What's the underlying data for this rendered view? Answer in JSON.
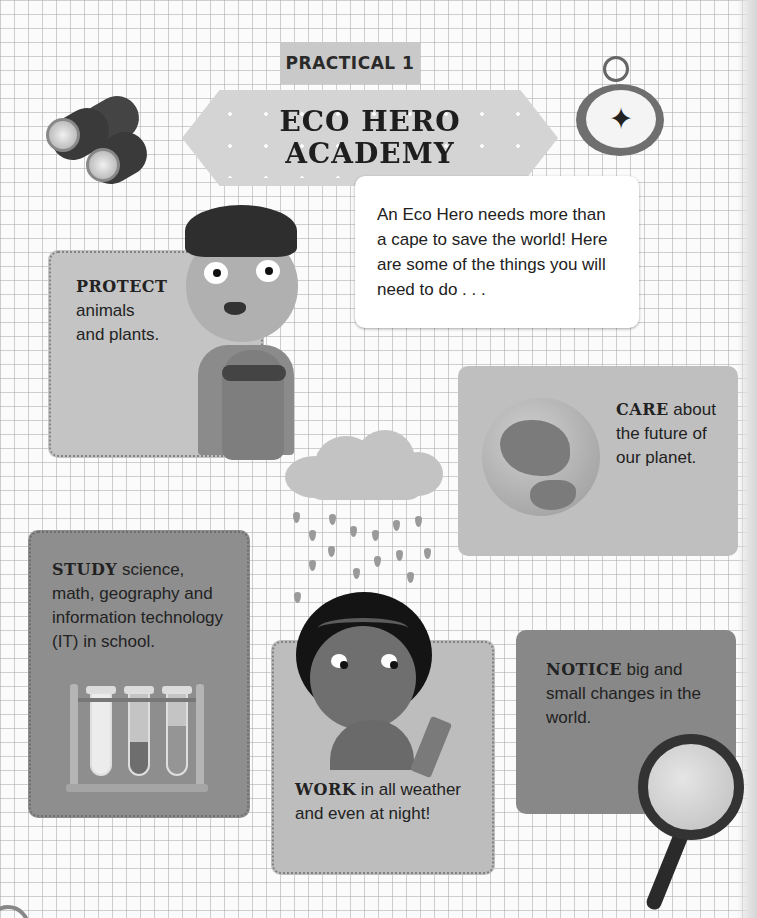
{
  "header": {
    "tab_label": "PRACTICAL 1",
    "title_line1": "ECO HERO",
    "title_line2": "ACADEMY"
  },
  "intro": {
    "text": "An Eco Hero needs more than a cape to save the world! Here are some of the things you will need to do . . ."
  },
  "cards": {
    "protect": {
      "keyword": "PROTECT",
      "line1": "animals",
      "line2": "and plants."
    },
    "care": {
      "keyword": "CARE",
      "rest": " about the future of our planet."
    },
    "study": {
      "keyword": "STUDY",
      "rest": " science, math, geography and information technology (IT) in school."
    },
    "work": {
      "keyword": "WORK",
      "rest": " in all weather and even at night!"
    },
    "notice": {
      "keyword": "NOTICE",
      "rest": " big and small changes in the world."
    }
  },
  "illustrations": {
    "binoculars": "binoculars-icon",
    "compass": "compass-icon",
    "boy_with_sloth": "boy-sloth-illustration",
    "globe": "globe-icon",
    "rain_cloud": "rain-cloud-icon",
    "girl_with_pencil": "girl-pencil-illustration",
    "test_tubes": "test-tubes-icon",
    "magnifying_glass": "magnifying-glass-icon"
  },
  "compass_glyph": "✦",
  "colors": {
    "grid_background": "#fbfbfb",
    "banner": "#d4d4d4",
    "tab": "#c9c9c9",
    "card_light": "#c4c4c4",
    "card_dark": "#8e8e8e",
    "text": "#1c1c1c"
  }
}
